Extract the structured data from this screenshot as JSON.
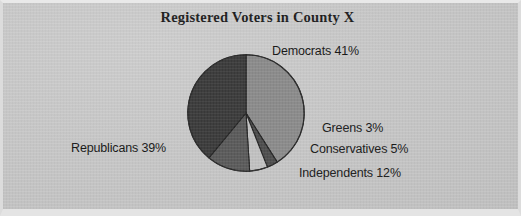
{
  "document": {
    "kind": "scanned-figure",
    "background_color": "#c8c8c8"
  },
  "chart_data": {
    "type": "pie",
    "title": "Registered Voters in County X",
    "xlabel": "",
    "ylabel": "",
    "legend_position": "none",
    "grid": false,
    "unit": "%",
    "start_angle_deg": 0,
    "direction": "clockwise",
    "categories": [
      "Democrats",
      "Greens",
      "Conservatives",
      "Independents",
      "Republicans"
    ],
    "values": [
      41,
      3,
      5,
      12,
      39
    ],
    "total": 100,
    "slices": [
      {
        "name": "Democrats",
        "value": 41,
        "label": "Democrats 41%",
        "color": "#8b8b8b",
        "start_deg": 0,
        "end_deg": 147.6
      },
      {
        "name": "Greens",
        "value": 3,
        "label": "Greens 3%",
        "color": "#4d4d4d",
        "start_deg": 147.6,
        "end_deg": 158.4
      },
      {
        "name": "Conservatives",
        "value": 5,
        "label": "Conservatives 5%",
        "color": "#c2c2c2",
        "start_deg": 158.4,
        "end_deg": 176.4
      },
      {
        "name": "Independents",
        "value": 12,
        "label": "Independents 12%",
        "color": "#5a5a5a",
        "start_deg": 176.4,
        "end_deg": 219.6
      },
      {
        "name": "Republicans",
        "value": 39,
        "label": "Republicans 39%",
        "color": "#3a3a3a",
        "start_deg": 219.6,
        "end_deg": 360
      }
    ]
  },
  "colors": {
    "title_text": "#1c1c1c",
    "label_text": "#161616",
    "slice_outline": "#232323",
    "page_background": "#c8c8c8",
    "page_frame": "#e4e4e4"
  }
}
